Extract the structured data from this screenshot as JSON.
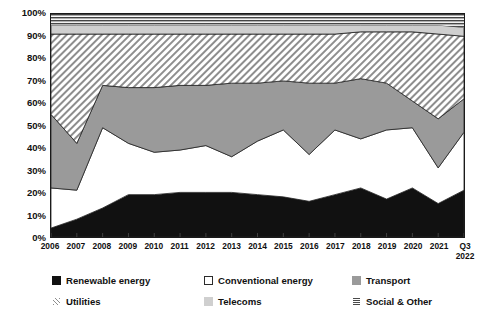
{
  "chart_data": {
    "type": "area",
    "stacked": true,
    "normalized_percent": true,
    "title": "",
    "xlabel": "",
    "ylabel": "",
    "ylim": [
      0,
      100
    ],
    "grid": false,
    "legend_position": "bottom",
    "categories": [
      "2006",
      "2007",
      "2008",
      "2009",
      "2010",
      "2011",
      "2012",
      "2013",
      "2014",
      "2015",
      "2016",
      "2017",
      "2018",
      "2019",
      "2020",
      "2021",
      "Q3 2022"
    ],
    "x_tick_labels": [
      {
        "line1": "2006",
        "line2": ""
      },
      {
        "line1": "2007",
        "line2": ""
      },
      {
        "line1": "2008",
        "line2": ""
      },
      {
        "line1": "2009",
        "line2": ""
      },
      {
        "line1": "2010",
        "line2": ""
      },
      {
        "line1": "2011",
        "line2": ""
      },
      {
        "line1": "2012",
        "line2": ""
      },
      {
        "line1": "2013",
        "line2": ""
      },
      {
        "line1": "2014",
        "line2": ""
      },
      {
        "line1": "2015",
        "line2": ""
      },
      {
        "line1": "2016",
        "line2": ""
      },
      {
        "line1": "2017",
        "line2": ""
      },
      {
        "line1": "2018",
        "line2": ""
      },
      {
        "line1": "2019",
        "line2": ""
      },
      {
        "line1": "2020",
        "line2": ""
      },
      {
        "line1": "2021",
        "line2": ""
      },
      {
        "line1": "Q3",
        "line2": "2022"
      }
    ],
    "y_tick_labels": [
      "0%",
      "10%",
      "20%",
      "30%",
      "40%",
      "50%",
      "60%",
      "70%",
      "80%",
      "90%",
      "100%"
    ],
    "y_tick_values": [
      0,
      10,
      20,
      30,
      40,
      50,
      60,
      70,
      80,
      90,
      100
    ],
    "series": [
      {
        "name": "Renewable energy",
        "fill": "black",
        "values": [
          4,
          8,
          13,
          19,
          19,
          20,
          20,
          20,
          19,
          18,
          16,
          19,
          22,
          17,
          22,
          15,
          21
        ]
      },
      {
        "name": "Conventional energy",
        "fill": "white",
        "values": [
          18,
          13,
          36,
          23,
          19,
          19,
          21,
          16,
          24,
          30,
          21,
          29,
          22,
          31,
          27,
          16,
          26
        ]
      },
      {
        "name": "Transport",
        "fill": "gray",
        "values": [
          33,
          21,
          19,
          25,
          29,
          29,
          27,
          33,
          26,
          22,
          32,
          21,
          27,
          21,
          12,
          22,
          15
        ]
      },
      {
        "name": "Utilities",
        "fill": "diagonal-hatch",
        "values": [
          36,
          49,
          23,
          24,
          24,
          23,
          23,
          22,
          22,
          21,
          22,
          22,
          21,
          23,
          31,
          38,
          28
        ]
      },
      {
        "name": "Telecoms",
        "fill": "light-gray",
        "values": [
          4,
          4,
          4,
          4,
          4,
          4,
          4,
          4,
          4,
          4,
          4,
          4,
          3,
          3,
          3,
          4,
          4
        ]
      },
      {
        "name": "Social & Other",
        "fill": "horizontal-lines",
        "values": [
          5,
          5,
          5,
          5,
          5,
          5,
          5,
          5,
          5,
          5,
          5,
          5,
          5,
          5,
          5,
          5,
          6
        ]
      }
    ]
  },
  "legend": {
    "items": [
      {
        "label": "Renewable energy",
        "swatch": "sw-renewable",
        "icon": "filled-square-black-icon"
      },
      {
        "label": "Conventional energy",
        "swatch": "sw-conventional",
        "icon": "open-square-white-icon"
      },
      {
        "label": "Transport",
        "swatch": "sw-transport",
        "icon": "filled-square-gray-icon"
      },
      {
        "label": "Utilities",
        "swatch": "sw-utilities",
        "icon": "diagonal-hatch-square-icon"
      },
      {
        "label": "Telecoms",
        "swatch": "sw-telecoms",
        "icon": "filled-square-lightgray-icon"
      },
      {
        "label": "Social & Other",
        "swatch": "sw-social",
        "icon": "horizontal-lines-square-icon"
      }
    ]
  },
  "colors": {
    "renewable": "#111111",
    "conventional": "#ffffff",
    "transport": "#9a9a9a",
    "utilities_hatch": "#8e8e8e",
    "telecoms": "#cfcfcf",
    "social_lines": "#4a4a4a",
    "axis": "#1a1a1a",
    "text": "#111111"
  }
}
